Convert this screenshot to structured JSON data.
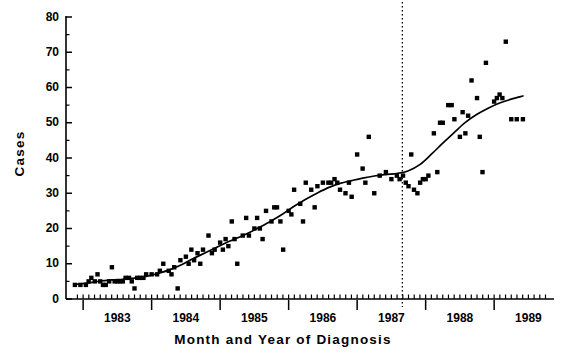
{
  "chart_data": {
    "type": "scatter",
    "title": "",
    "xlabel": "Month and Year of Diagnosis",
    "ylabel": "Cases",
    "xlim": [
      1982.75,
      1989.83
    ],
    "ylim": [
      0,
      80
    ],
    "ytick_values": [
      0,
      10,
      20,
      30,
      40,
      50,
      60,
      70,
      80
    ],
    "ytick_labels": [
      "0",
      "10",
      "20",
      "30",
      "40",
      "50",
      "60",
      "70",
      "80"
    ],
    "y_minor_tick_step": 5,
    "xtick_labels": [
      "1983",
      "1984",
      "1985",
      "1986",
      "1987",
      "1988",
      "1989"
    ],
    "xtick_values": [
      1983.5,
      1984.5,
      1985.5,
      1986.5,
      1987.5,
      1988.5,
      1989.5
    ],
    "x_major_tick_values": [
      1983.0,
      1984.0,
      1985.0,
      1986.0,
      1987.0,
      1988.0,
      1989.0,
      1990.0
    ],
    "x_minor_tick_step": 0.08333,
    "grid": false,
    "legend": null,
    "marker": "filled-square",
    "marker_color": "#000000",
    "annotations": [
      {
        "name": "vertical-reference-line",
        "type": "vline",
        "x": 1987.66,
        "style": "dotted",
        "color": "#000000"
      }
    ],
    "series": [
      {
        "name": "Monthly cases",
        "type": "scatter",
        "points": [
          [
            1982.88,
            4
          ],
          [
            1982.96,
            4
          ],
          [
            1983.04,
            4
          ],
          [
            1983.08,
            5
          ],
          [
            1983.12,
            6
          ],
          [
            1983.17,
            5
          ],
          [
            1983.21,
            7
          ],
          [
            1983.25,
            5
          ],
          [
            1983.29,
            4
          ],
          [
            1983.33,
            4
          ],
          [
            1983.38,
            5
          ],
          [
            1983.42,
            9
          ],
          [
            1983.46,
            5
          ],
          [
            1983.5,
            5
          ],
          [
            1983.54,
            5
          ],
          [
            1983.58,
            5
          ],
          [
            1983.62,
            6
          ],
          [
            1983.67,
            6
          ],
          [
            1983.71,
            5
          ],
          [
            1983.75,
            3
          ],
          [
            1983.79,
            6
          ],
          [
            1983.83,
            6
          ],
          [
            1983.88,
            6
          ],
          [
            1983.92,
            7
          ],
          [
            1984.0,
            7
          ],
          [
            1984.08,
            7
          ],
          [
            1984.12,
            8
          ],
          [
            1984.17,
            10
          ],
          [
            1984.25,
            8
          ],
          [
            1984.29,
            7
          ],
          [
            1984.33,
            9
          ],
          [
            1984.38,
            3
          ],
          [
            1984.42,
            11
          ],
          [
            1984.5,
            12
          ],
          [
            1984.54,
            10
          ],
          [
            1984.58,
            14
          ],
          [
            1984.62,
            11
          ],
          [
            1984.67,
            13
          ],
          [
            1984.71,
            10
          ],
          [
            1984.75,
            14
          ],
          [
            1984.83,
            18
          ],
          [
            1984.88,
            13
          ],
          [
            1984.92,
            14
          ],
          [
            1985.0,
            16
          ],
          [
            1985.04,
            14
          ],
          [
            1985.08,
            17
          ],
          [
            1985.12,
            15
          ],
          [
            1985.17,
            22
          ],
          [
            1985.21,
            17
          ],
          [
            1985.25,
            10
          ],
          [
            1985.33,
            18
          ],
          [
            1985.38,
            23
          ],
          [
            1985.42,
            18
          ],
          [
            1985.5,
            20
          ],
          [
            1985.54,
            23
          ],
          [
            1985.58,
            20
          ],
          [
            1985.62,
            17
          ],
          [
            1985.67,
            25
          ],
          [
            1985.75,
            22
          ],
          [
            1985.79,
            26
          ],
          [
            1985.83,
            26
          ],
          [
            1985.88,
            22
          ],
          [
            1985.92,
            14
          ],
          [
            1986.0,
            25
          ],
          [
            1986.04,
            24
          ],
          [
            1986.08,
            31
          ],
          [
            1986.17,
            27
          ],
          [
            1986.21,
            22
          ],
          [
            1986.25,
            33
          ],
          [
            1986.33,
            31
          ],
          [
            1986.38,
            26
          ],
          [
            1986.42,
            32
          ],
          [
            1986.5,
            33
          ],
          [
            1986.58,
            33
          ],
          [
            1986.62,
            33
          ],
          [
            1986.67,
            34
          ],
          [
            1986.71,
            33
          ],
          [
            1986.75,
            31
          ],
          [
            1986.83,
            30
          ],
          [
            1986.88,
            33
          ],
          [
            1986.92,
            29
          ],
          [
            1987.0,
            41
          ],
          [
            1987.08,
            37
          ],
          [
            1987.12,
            33
          ],
          [
            1987.17,
            46
          ],
          [
            1987.25,
            30
          ],
          [
            1987.33,
            35
          ],
          [
            1987.42,
            36
          ],
          [
            1987.5,
            34
          ],
          [
            1987.58,
            35
          ],
          [
            1987.62,
            34
          ],
          [
            1987.67,
            35
          ],
          [
            1987.71,
            33
          ],
          [
            1987.75,
            32
          ],
          [
            1987.79,
            41
          ],
          [
            1987.83,
            31
          ],
          [
            1987.88,
            30
          ],
          [
            1987.92,
            33
          ],
          [
            1987.96,
            34
          ],
          [
            1988.0,
            34
          ],
          [
            1988.04,
            35
          ],
          [
            1988.12,
            47
          ],
          [
            1988.17,
            36
          ],
          [
            1988.21,
            50
          ],
          [
            1988.25,
            50
          ],
          [
            1988.33,
            55
          ],
          [
            1988.38,
            55
          ],
          [
            1988.42,
            51
          ],
          [
            1988.5,
            46
          ],
          [
            1988.54,
            53
          ],
          [
            1988.58,
            47
          ],
          [
            1988.62,
            52
          ],
          [
            1988.67,
            62
          ],
          [
            1988.75,
            57
          ],
          [
            1988.79,
            46
          ],
          [
            1988.83,
            36
          ],
          [
            1988.88,
            67
          ],
          [
            1989.0,
            56
          ],
          [
            1989.04,
            57
          ],
          [
            1989.08,
            58
          ],
          [
            1989.12,
            57
          ],
          [
            1989.17,
            73
          ],
          [
            1989.25,
            51
          ],
          [
            1989.33,
            51
          ],
          [
            1989.42,
            51
          ]
        ]
      },
      {
        "name": "Smoothed trend",
        "type": "line",
        "points": [
          [
            1982.92,
            4.2
          ],
          [
            1983.08,
            4.6
          ],
          [
            1983.25,
            5.1
          ],
          [
            1983.42,
            5.4
          ],
          [
            1983.58,
            5.6
          ],
          [
            1983.75,
            5.9
          ],
          [
            1983.92,
            6.4
          ],
          [
            1984.08,
            7.2
          ],
          [
            1984.25,
            8.2
          ],
          [
            1984.42,
            9.6
          ],
          [
            1984.58,
            11.2
          ],
          [
            1984.75,
            12.8
          ],
          [
            1984.92,
            14.4
          ],
          [
            1985.08,
            15.9
          ],
          [
            1985.25,
            17.3
          ],
          [
            1985.42,
            18.8
          ],
          [
            1985.58,
            20.4
          ],
          [
            1985.75,
            22.2
          ],
          [
            1985.92,
            24.2
          ],
          [
            1986.08,
            26.3
          ],
          [
            1986.25,
            28.3
          ],
          [
            1986.42,
            30.1
          ],
          [
            1986.58,
            31.6
          ],
          [
            1986.75,
            32.8
          ],
          [
            1986.92,
            33.6
          ],
          [
            1987.08,
            34.3
          ],
          [
            1987.25,
            34.9
          ],
          [
            1987.42,
            35.3
          ],
          [
            1987.58,
            35.6
          ],
          [
            1987.75,
            36.4
          ],
          [
            1987.92,
            38.2
          ],
          [
            1988.08,
            41.0
          ],
          [
            1988.25,
            44.2
          ],
          [
            1988.42,
            47.3
          ],
          [
            1988.58,
            50.1
          ],
          [
            1988.75,
            52.4
          ],
          [
            1988.92,
            54.2
          ],
          [
            1989.08,
            55.6
          ],
          [
            1989.25,
            56.7
          ],
          [
            1989.42,
            57.6
          ]
        ]
      }
    ]
  }
}
